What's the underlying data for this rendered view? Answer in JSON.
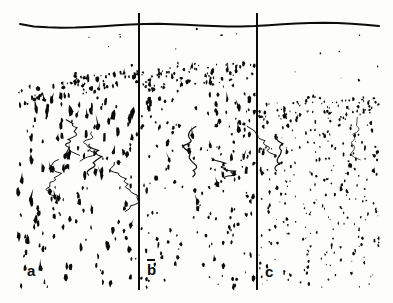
{
  "figure": {
    "kind": "histology-micrograph",
    "width": 393,
    "height": 303,
    "background_color": "#fdfdfb",
    "ink_color": "#0b0b0b",
    "content_bounds": {
      "left": 18,
      "top": 14,
      "right": 379,
      "bottom": 289
    }
  },
  "surface_line": {
    "name": "pial-surface-line",
    "y_base": 24,
    "x_start": 20,
    "x_end": 379,
    "stroke_width": 2.0,
    "waviness": 3.2,
    "color": "#0b0b0b"
  },
  "dividers": [
    {
      "label": "divider-1",
      "x": 139,
      "y_top": 13,
      "y_bottom": 290,
      "stroke_width": 2.0,
      "color": "#0b0b0b"
    },
    {
      "label": "divider-2",
      "x": 257,
      "y_top": 13,
      "y_bottom": 290,
      "stroke_width": 2.0,
      "color": "#0b0b0b"
    }
  ],
  "panels": [
    {
      "id": "a",
      "label": "a",
      "label_overbar": false,
      "x_start": 18,
      "x_end": 138,
      "sparse_zone": {
        "y_top": 28,
        "y_bottom": 62,
        "density": 0.00105,
        "size_min": 0.9,
        "size_max": 2.6
      },
      "dense_band": {
        "y_left": 86,
        "y_right": 66,
        "thickness": 20,
        "density": 0.03,
        "size_min": 1.6,
        "size_max": 4.4,
        "description": "pyramidal cell layer, sloping up to the right"
      },
      "body_zone": {
        "y_top": 96,
        "y_bottom": 288,
        "density": 0.0068,
        "size_min": 1.8,
        "size_max": 5.4,
        "elongation": 2.1,
        "cell_shape": "pyramidal-with-apical-dendrite",
        "description": "large triangular somata with upward apical processes, moderately sparse"
      },
      "fibers": 5
    },
    {
      "id": "b",
      "label": "b",
      "label_overbar": true,
      "x_start": 141,
      "x_end": 255,
      "sparse_zone": {
        "y_top": 28,
        "y_bottom": 56,
        "density": 0.0013,
        "size_min": 1.0,
        "size_max": 2.8
      },
      "dense_band": {
        "y_left": 68,
        "y_right": 62,
        "thickness": 22,
        "density": 0.034,
        "size_min": 1.5,
        "size_max": 4.0,
        "description": "dense cell band, higher and thicker than panel a"
      },
      "body_zone": {
        "y_top": 90,
        "y_bottom": 288,
        "density": 0.0082,
        "size_min": 1.6,
        "size_max": 4.6,
        "elongation": 1.7,
        "cell_shape": "rounded-and-pyramidal",
        "description": "mixed round and triangular cells, medium density"
      },
      "fibers": 3
    },
    {
      "id": "c",
      "label": "c",
      "label_overbar": false,
      "x_start": 259,
      "x_end": 379,
      "sparse_zone": {
        "y_top": 28,
        "y_bottom": 90,
        "density": 0.0009,
        "size_min": 0.9,
        "size_max": 2.4
      },
      "dense_band": {
        "y_left": 102,
        "y_right": 98,
        "thickness": 16,
        "density": 0.04,
        "size_min": 1.3,
        "size_max": 3.4,
        "description": "thin very dark band, lowest of the three panels"
      },
      "body_zone": {
        "y_top": 116,
        "y_bottom": 288,
        "density": 0.0125,
        "size_min": 1.2,
        "size_max": 3.6,
        "elongation": 1.5,
        "cell_shape": "small-granular",
        "description": "many small densely packed cells"
      },
      "fibers": 2
    }
  ],
  "labels": {
    "a": "a",
    "b": "b",
    "c": "c"
  }
}
